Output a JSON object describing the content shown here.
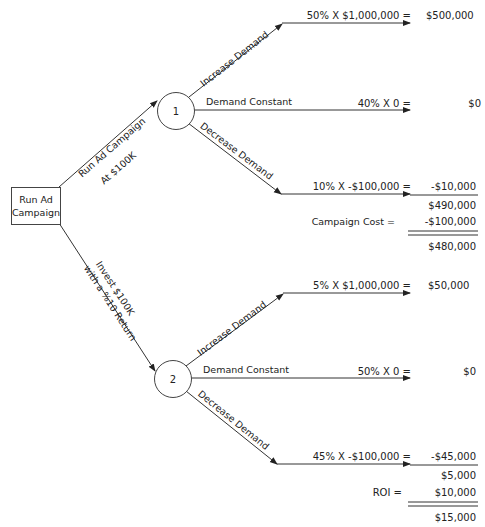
{
  "root": {
    "label_line1": "Run Ad",
    "label_line2": "Campaign"
  },
  "branches": {
    "top": {
      "line1": "Run Ad Campaign",
      "line2": "At $100K"
    },
    "bottom": {
      "line1": "Invest $100K",
      "line2": "with a %10 Return"
    }
  },
  "node1": {
    "label": "1",
    "outcomes": [
      {
        "branch": "Increase Demand",
        "formula": "50% X $1,000,000 =",
        "value": "$500,000"
      },
      {
        "branch": "Demand Constant",
        "formula": "40% X 0 =",
        "value": "$0"
      },
      {
        "branch": "Decrease Demand",
        "formula": "10% X -$100,000 =",
        "value": "-$10,000"
      }
    ],
    "subtotal": "$490,000",
    "adjust_label": "Campaign Cost =",
    "adjust_value": "-$100,000",
    "total": "$480,000"
  },
  "node2": {
    "label": "2",
    "outcomes": [
      {
        "branch": "Increase Demand",
        "formula": "5% X $1,000,000 =",
        "value": "$50,000"
      },
      {
        "branch": "Demand Constant",
        "formula": "50% X 0 =",
        "value": "$0"
      },
      {
        "branch": "Decrease Demand",
        "formula": "45% X -$100,000 =",
        "value": "-$45,000"
      }
    ],
    "subtotal": "$5,000",
    "adjust_label": "ROI =",
    "adjust_value": "$10,000",
    "total": "$15,000"
  }
}
